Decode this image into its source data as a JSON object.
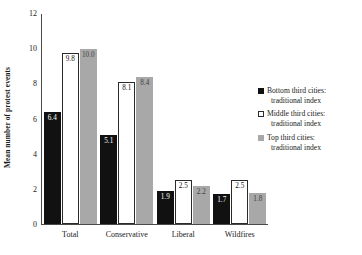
{
  "chart_data": {
    "type": "bar",
    "title": "",
    "xlabel": "",
    "ylabel": "Mean number of protest events",
    "ylim": [
      0,
      12
    ],
    "yticks": [
      0,
      2,
      4,
      6,
      8,
      10,
      12
    ],
    "grid": false,
    "legend_position": "right",
    "categories": [
      "Total",
      "Conservative",
      "Liberal",
      "Wildfires"
    ],
    "series": [
      {
        "name": "Bottom third cities: traditional index",
        "name_line1": "Bottom third cities:",
        "name_line2": "traditional index",
        "color": "#111111",
        "values": [
          6.4,
          5.1,
          1.9,
          1.7
        ],
        "labels": [
          "6.4",
          "5.1",
          "1.9",
          "1.7"
        ]
      },
      {
        "name": "Middle third cities: traditional index",
        "name_line1": "Middle third cities:",
        "name_line2": "traditional index",
        "color": "#ffffff",
        "values": [
          9.8,
          8.1,
          2.5,
          2.5
        ],
        "labels": [
          "9.8",
          "8.1",
          "2.5",
          "2.5"
        ]
      },
      {
        "name": "Top third cities: traditional index",
        "name_line1": "Top third cities:",
        "name_line2": "traditional index",
        "color": "#a8a8a8",
        "values": [
          10.0,
          8.4,
          2.2,
          1.8
        ],
        "labels": [
          "10.0",
          "8.4",
          "2.2",
          "1.8"
        ]
      }
    ]
  }
}
